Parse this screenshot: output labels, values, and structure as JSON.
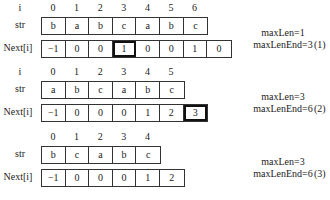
{
  "labels": {
    "i": "i",
    "str": "str",
    "next": "Next[i]"
  },
  "panels": [
    {
      "id": "1",
      "show_i_label": true,
      "indices": [
        "0",
        "1",
        "2",
        "3",
        "4",
        "5",
        "6"
      ],
      "str": [
        "b",
        "a",
        "b",
        "c",
        "a",
        "b",
        "c"
      ],
      "next": [
        "−1",
        "0",
        "0",
        "1",
        "0",
        "0",
        "1",
        "0"
      ],
      "highlight_next": 3,
      "note": {
        "line1": "maxLen=1",
        "line2": "maxLenEnd=3"
      },
      "tag": "(1)"
    },
    {
      "id": "2",
      "show_i_label": true,
      "indices": [
        "0",
        "1",
        "2",
        "3",
        "4",
        "5"
      ],
      "str": [
        "a",
        "b",
        "c",
        "a",
        "b",
        "c"
      ],
      "next": [
        "−1",
        "0",
        "0",
        "0",
        "1",
        "2",
        "3"
      ],
      "highlight_next": 6,
      "note": {
        "line1": "maxLen=3",
        "line2": "maxLenEnd=6"
      },
      "tag": "(2)"
    },
    {
      "id": "3",
      "show_i_label": false,
      "indices": [
        "0",
        "1",
        "2",
        "3",
        "4"
      ],
      "str": [
        "b",
        "c",
        "a",
        "b",
        "c"
      ],
      "next": [
        "−1",
        "0",
        "0",
        "0",
        "1",
        "2"
      ],
      "highlight_next": -1,
      "note": {
        "line1": "maxLen=3",
        "line2": "maxLenEnd=6"
      },
      "tag": "(3)"
    }
  ]
}
